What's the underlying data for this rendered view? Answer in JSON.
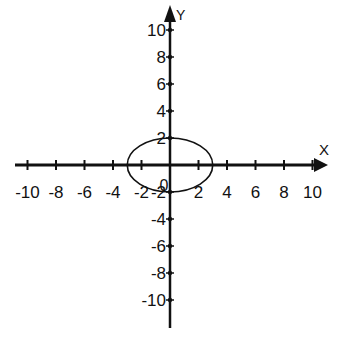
{
  "chart_data": {
    "type": "line",
    "title": "",
    "xlabel": "X",
    "ylabel": "Y",
    "xlim": [
      -10,
      10
    ],
    "ylim": [
      -10,
      10
    ],
    "grid": false,
    "x_ticks": [
      -10,
      -8,
      -6,
      -4,
      -2,
      2,
      4,
      6,
      8,
      10
    ],
    "y_ticks": [
      10,
      8,
      6,
      4,
      2,
      -2,
      -4,
      -6,
      -8,
      -10
    ],
    "x_tick_labels": [
      "-10",
      "-8",
      "-6",
      "-4",
      "-2",
      "2",
      "4",
      "6",
      "8",
      "10"
    ],
    "y_tick_labels": [
      "10",
      "8",
      "6",
      "4",
      "2",
      "-2",
      "-4",
      "-6",
      "-8",
      "-10"
    ],
    "origin_label": "0",
    "series": [
      {
        "name": "ellipse",
        "shape": "ellipse",
        "center": [
          0,
          0
        ],
        "semi_axis_x": 3,
        "semi_axis_y": 2,
        "equation": "x^2/9 + y^2/4 = 1"
      }
    ]
  },
  "axes": {
    "x_label": "X",
    "y_label": "Y"
  },
  "colors": {
    "ink": "#111111",
    "background": "#ffffff"
  }
}
